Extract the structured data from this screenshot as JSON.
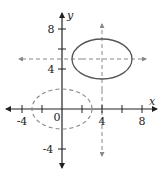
{
  "figure": {
    "colors": {
      "axis": "#222222",
      "solid_ellipse": "#555555",
      "dashed": "#888888"
    }
  },
  "axes": {
    "x_label": "x",
    "y_label": "y",
    "origin_label": "0",
    "x_ticks": [
      -4,
      -2,
      2,
      4,
      6,
      8
    ],
    "y_ticks": [
      -4,
      4,
      6,
      8
    ],
    "x_tick_labels": [
      "-4",
      "4",
      "8"
    ],
    "y_tick_labels": [
      "-4",
      "4",
      "8"
    ],
    "xlim": [
      -5.5,
      9.5
    ],
    "ylim": [
      -5.8,
      9.5
    ]
  },
  "shapes": {
    "original_ellipse": {
      "style": "dashed",
      "center": [
        0,
        0
      ],
      "rx": 3,
      "ry": 2
    },
    "translated_ellipse": {
      "style": "solid",
      "center": [
        4,
        5
      ],
      "rx": 3,
      "ry": 2
    },
    "guide_lines": [
      {
        "orientation": "horizontal",
        "y": 5,
        "style": "dashed-arrows"
      },
      {
        "orientation": "vertical",
        "x": 4,
        "style": "dashed-arrows"
      }
    ]
  }
}
